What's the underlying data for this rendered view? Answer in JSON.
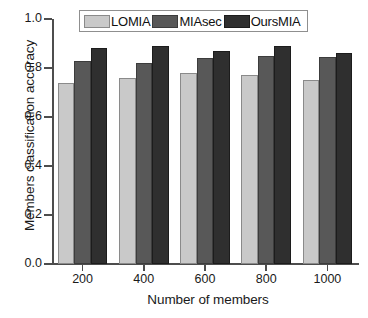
{
  "chart_data": {
    "type": "bar",
    "title": "",
    "xlabel": "Number of members",
    "ylabel": "Members classification accuracy",
    "categories": [
      "200",
      "400",
      "600",
      "800",
      "1000"
    ],
    "series": [
      {
        "name": "LOMIA",
        "color": "#c9c9c9",
        "values": [
          0.74,
          0.76,
          0.78,
          0.77,
          0.75
        ]
      },
      {
        "name": "MIAsec",
        "color": "#585858",
        "values": [
          0.83,
          0.82,
          0.84,
          0.85,
          0.845
        ]
      },
      {
        "name": "OursMIA",
        "color": "#2f2f2f",
        "values": [
          0.88,
          0.89,
          0.87,
          0.89,
          0.86
        ]
      }
    ],
    "ylim": [
      0.0,
      1.0
    ],
    "ytick_labels": [
      "0.0",
      "0.2",
      "0.4",
      "0.6",
      "0.8",
      "1.0"
    ],
    "ytick_values": [
      0.0,
      0.2,
      0.4,
      0.6,
      0.8,
      1.0
    ],
    "grid": false,
    "legend_position": "top-center"
  }
}
